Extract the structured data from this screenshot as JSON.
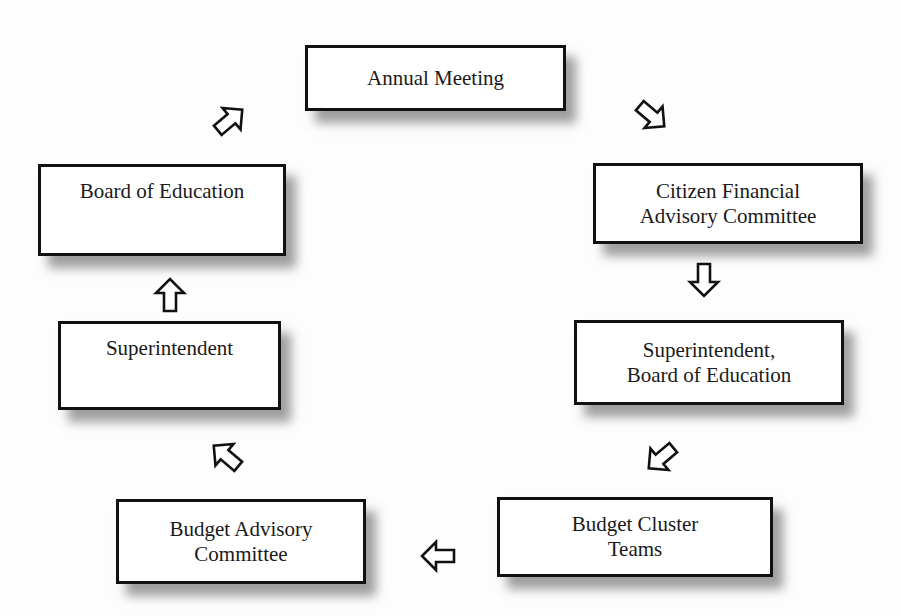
{
  "diagram": {
    "type": "cycle-flowchart",
    "nodes": [
      {
        "id": "annual-meeting",
        "lines": [
          "Annual Meeting"
        ]
      },
      {
        "id": "citizen-financial-advisory-committee",
        "lines": [
          "Citizen Financial",
          "Advisory Committee"
        ]
      },
      {
        "id": "superintendent-board-of-education",
        "lines": [
          "Superintendent,",
          "Board of Education"
        ]
      },
      {
        "id": "budget-cluster-teams",
        "lines": [
          "Budget Cluster",
          "Teams"
        ]
      },
      {
        "id": "budget-advisory-committee",
        "lines": [
          "Budget Advisory",
          "Committee"
        ]
      },
      {
        "id": "superintendent",
        "lines": [
          "Superintendent"
        ]
      },
      {
        "id": "board-of-education",
        "lines": [
          "Board of Education"
        ]
      }
    ],
    "edges": [
      {
        "from": "annual-meeting",
        "to": "citizen-financial-advisory-committee",
        "arrow": "down-right"
      },
      {
        "from": "citizen-financial-advisory-committee",
        "to": "superintendent-board-of-education",
        "arrow": "down"
      },
      {
        "from": "superintendent-board-of-education",
        "to": "budget-cluster-teams",
        "arrow": "down-left"
      },
      {
        "from": "budget-cluster-teams",
        "to": "budget-advisory-committee",
        "arrow": "left"
      },
      {
        "from": "budget-advisory-committee",
        "to": "superintendent",
        "arrow": "up-left"
      },
      {
        "from": "superintendent",
        "to": "board-of-education",
        "arrow": "up"
      },
      {
        "from": "board-of-education",
        "to": "annual-meeting",
        "arrow": "up-right"
      }
    ],
    "colors": {
      "border": "#111111",
      "box_fill": "#ffffff",
      "shadow": "#808080",
      "background": "#fdfdfd",
      "text": "#1a1a1a"
    }
  }
}
